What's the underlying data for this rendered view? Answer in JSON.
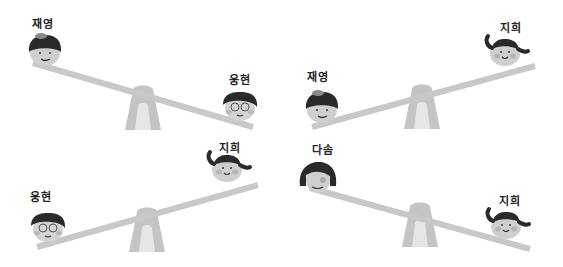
{
  "illustration": {
    "style": "grayscale",
    "colors": {
      "beam": "#c8c8c8",
      "fulcrum": "#c4c4c4",
      "fulcrum_inner": "#e6e6e6",
      "skin": "#cfcfcf",
      "hair": "#2a2a2a",
      "cheek": "#b5b5b5"
    },
    "panels": [
      {
        "id": "top-left",
        "tilt": "left-up",
        "children": [
          {
            "name": "재영",
            "side": "left",
            "position": "up"
          },
          {
            "name": "웅현",
            "side": "right",
            "position": "down"
          }
        ]
      },
      {
        "id": "top-right",
        "tilt": "right-up",
        "children": [
          {
            "name": "재영",
            "side": "left",
            "position": "down"
          },
          {
            "name": "지희",
            "side": "right",
            "position": "up"
          }
        ]
      },
      {
        "id": "bottom-left",
        "tilt": "right-up",
        "children": [
          {
            "name": "웅현",
            "side": "left",
            "position": "down"
          },
          {
            "name": "지희",
            "side": "right",
            "position": "up"
          }
        ]
      },
      {
        "id": "bottom-right",
        "tilt": "left-up",
        "children": [
          {
            "name": "다솜",
            "side": "left",
            "position": "up"
          },
          {
            "name": "지희",
            "side": "right",
            "position": "down"
          }
        ]
      }
    ]
  }
}
